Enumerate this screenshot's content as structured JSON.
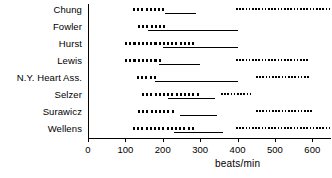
{
  "chart_data": {
    "type": "bar",
    "title": "",
    "subtitle": "",
    "xlabel": "beats/min",
    "ylabel": "",
    "xlim": [
      0,
      650
    ],
    "ylim": null,
    "grid": false,
    "legend": null,
    "orientation": "horizontal",
    "xticks": [
      0,
      100,
      200,
      300,
      400,
      500,
      600
    ],
    "xtick_labels": [
      "0",
      "100",
      "200",
      "300",
      "400",
      "500",
      "600"
    ],
    "categories": [
      "Chung",
      "Fowler",
      "Hurst",
      "Lewis",
      "N.Y. Heart Ass.",
      "Selzer",
      "Surawicz",
      "Wellens"
    ],
    "segment_types": {
      "thick_dotted": "primary range (heavy dotted bar)",
      "solid": "secondary range (thin solid line)",
      "fine_dotted": "upper range (fine dotted bar)"
    },
    "rows": [
      {
        "category": "Chung",
        "segments": [
          {
            "style": "thick_dotted",
            "start": 120,
            "end": 210
          },
          {
            "style": "solid",
            "start": 205,
            "end": 290
          },
          {
            "style": "fine_dotted",
            "start": 395,
            "end": 650
          }
        ]
      },
      {
        "category": "Fowler",
        "segments": [
          {
            "style": "thick_dotted",
            "start": 135,
            "end": 205
          },
          {
            "style": "solid",
            "start": 160,
            "end": 400
          }
        ]
      },
      {
        "category": "Hurst",
        "segments": [
          {
            "style": "thick_dotted",
            "start": 100,
            "end": 290
          },
          {
            "style": "solid",
            "start": 200,
            "end": 400
          }
        ]
      },
      {
        "category": "Lewis",
        "segments": [
          {
            "style": "thick_dotted",
            "start": 100,
            "end": 195
          },
          {
            "style": "solid",
            "start": 190,
            "end": 300
          },
          {
            "style": "fine_dotted",
            "start": 395,
            "end": 590
          }
        ]
      },
      {
        "category": "N.Y. Heart Ass.",
        "segments": [
          {
            "style": "thick_dotted",
            "start": 130,
            "end": 185
          },
          {
            "style": "solid",
            "start": 180,
            "end": 400
          },
          {
            "style": "fine_dotted",
            "start": 450,
            "end": 590
          }
        ]
      },
      {
        "category": "Selzer",
        "segments": [
          {
            "style": "thick_dotted",
            "start": 145,
            "end": 300
          },
          {
            "style": "solid",
            "start": 215,
            "end": 340
          },
          {
            "style": "fine_dotted",
            "start": 355,
            "end": 440
          }
        ]
      },
      {
        "category": "Surawicz",
        "segments": [
          {
            "style": "thick_dotted",
            "start": 135,
            "end": 235
          },
          {
            "style": "solid",
            "start": 245,
            "end": 345
          },
          {
            "style": "fine_dotted",
            "start": 450,
            "end": 600
          }
        ]
      },
      {
        "category": "Wellens",
        "segments": [
          {
            "style": "thick_dotted",
            "start": 120,
            "end": 290
          },
          {
            "style": "solid",
            "start": 230,
            "end": 360
          },
          {
            "style": "fine_dotted",
            "start": 395,
            "end": 650
          }
        ]
      }
    ]
  },
  "axis": {
    "title": "beats/min"
  }
}
